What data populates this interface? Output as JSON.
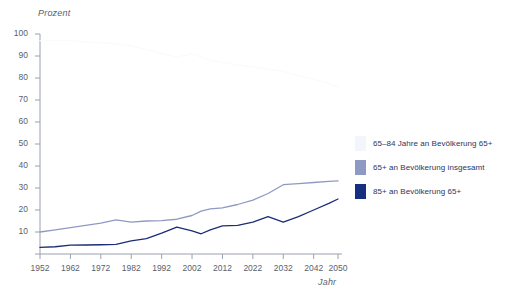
{
  "chart_data": {
    "type": "line",
    "title": "",
    "xlabel": "Jahr",
    "ylabel": "Prozent",
    "xlim": [
      1952,
      2050
    ],
    "ylim": [
      0,
      100
    ],
    "grid": false,
    "legend_position": "right",
    "x_ticks": [
      "1952",
      "1962",
      "1972",
      "1982",
      "1992",
      "2002",
      "2012",
      "2022",
      "2032",
      "2042",
      "2050"
    ],
    "y_ticks": [
      "0",
      "10",
      "20",
      "30",
      "40",
      "50",
      "60",
      "70",
      "80",
      "90",
      "100"
    ],
    "x": [
      1952,
      1957,
      1962,
      1967,
      1972,
      1977,
      1982,
      1987,
      1992,
      1997,
      2002,
      2005,
      2008,
      2012,
      2017,
      2022,
      2027,
      2032,
      2037,
      2042,
      2047,
      2050
    ],
    "series": [
      {
        "name": "65–84 Jahre an Bevölkerung 65+",
        "color": "#fafbfd",
        "values": [
          97,
          97,
          97,
          96.5,
          96,
          95.5,
          94.5,
          93,
          91,
          89.5,
          91,
          89.5,
          88,
          87,
          86,
          85,
          84,
          83,
          81,
          79.5,
          77.5,
          76
        ]
      },
      {
        "name": "65+ an Bevölkerung insgesamt",
        "color": "#8e9ac4",
        "values": [
          10,
          11,
          12,
          13,
          14,
          15.5,
          14.5,
          15,
          15.2,
          15.8,
          17.5,
          19.5,
          20.5,
          21,
          22.5,
          24.5,
          27.5,
          31.5,
          32,
          32.5,
          33,
          33.2
        ]
      },
      {
        "name": "85+ an Bevölkerung 65+",
        "color": "#1b2d78",
        "values": [
          3,
          3.3,
          4,
          4.1,
          4.2,
          4.4,
          6,
          7,
          9.5,
          12.2,
          10.5,
          9.2,
          11,
          12.8,
          13,
          14.5,
          17,
          14.5,
          17,
          20,
          23,
          25
        ]
      }
    ]
  },
  "legend": {
    "items": [
      {
        "label": "65–84 Jahre an Bevölkerung 65+",
        "color": "#f2f5fa"
      },
      {
        "label": "65+ an Bevölkerung insgesamt",
        "color": "#8e9ac4"
      },
      {
        "label": "85+ an Bevölkerung 65+",
        "color": "#16307f"
      }
    ]
  },
  "axes": {
    "y_title": "Prozent",
    "x_title": "Jahr",
    "axis_color": "#9aa0b0"
  }
}
